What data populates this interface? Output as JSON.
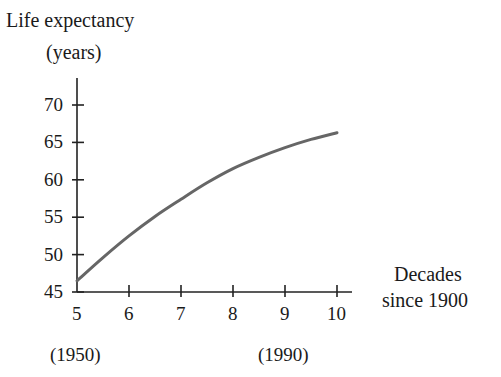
{
  "chart_data": {
    "type": "line",
    "title": "",
    "ylabel": "Life expectancy (years)",
    "ylabel_lines": [
      "Life expectancy",
      "(years)"
    ],
    "xlabel": "Decades since 1900",
    "xlabel_lines": [
      "Decades",
      "since 1900"
    ],
    "xlim": [
      5,
      10
    ],
    "ylim": [
      45,
      70
    ],
    "x_ticks": [
      5,
      6,
      7,
      8,
      9,
      10
    ],
    "x_tick_labels": [
      "5",
      "6",
      "7",
      "8",
      "9",
      "10"
    ],
    "y_ticks": [
      45,
      50,
      55,
      60,
      65,
      70
    ],
    "y_tick_labels": [
      "45",
      "50",
      "55",
      "60",
      "65",
      "70"
    ],
    "annotations": [
      {
        "text": "(1950)",
        "x": 5
      },
      {
        "text": "(1990)",
        "x": 9
      }
    ],
    "grid": false,
    "legend": null,
    "series": [
      {
        "name": "Life expectancy",
        "color": "#666666",
        "x": [
          5,
          5.5,
          6,
          6.5,
          7,
          7.5,
          8,
          8.5,
          9,
          9.5,
          10
        ],
        "values": [
          46.5,
          49.6,
          52.5,
          55.1,
          57.4,
          59.6,
          61.5,
          63.0,
          64.3,
          65.4,
          66.3
        ]
      }
    ]
  }
}
